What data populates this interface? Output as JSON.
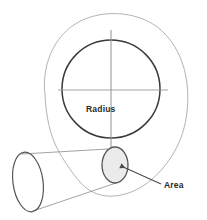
{
  "figure": {
    "background_color": "#ffffff",
    "width": 207,
    "height": 220
  },
  "labels": {
    "radius": "Radius",
    "area": "Area"
  },
  "colors": {
    "outer_contour": "#aaaaaa",
    "circle_stroke": "#3a3a3a",
    "cone_stroke": "#8a8a8a",
    "ellipse_stroke": "#555555",
    "axis_line": "#9a9a9a",
    "arrow": "#7d7d7d",
    "area_leader": "#4a4a4a",
    "small_ellipse_fill": "#ebebeb",
    "text": "#2b2b2b"
  },
  "shapes": {
    "outer_contour": {
      "name": "outer-irregular-contour",
      "stroke_width": 0.9
    },
    "main_circle": {
      "name": "main-circle",
      "center_x": 111,
      "center_y": 89,
      "radius": 49,
      "stroke_width": 1.5
    },
    "horizontal_axis": {
      "name": "horizontal-diameter-line",
      "x1": 58,
      "y1": 90,
      "x2": 168,
      "y2": 90
    },
    "vertical_axis": {
      "name": "vertical-radius-line",
      "x1": 111,
      "y1": 30,
      "x2": 111,
      "y2": 168
    },
    "small_ellipse": {
      "name": "small-cross-section-ellipse",
      "center_x": 115,
      "center_y": 165,
      "rx": 13,
      "ry": 18
    },
    "large_ellipse": {
      "name": "large-cone-base-ellipse",
      "center_x": 28,
      "center_y": 182,
      "rx": 15,
      "ry": 30
    },
    "cone_body": {
      "name": "cone-frustum-body"
    }
  },
  "annotations": {
    "radius_arrow": {
      "name": "radius-arrow",
      "direction": "down",
      "tip_x": 111,
      "tip_y": 167
    },
    "area_leader_line": {
      "name": "area-leader-line",
      "from_x": 160,
      "from_y": 184,
      "to_x": 118,
      "to_y": 165
    }
  }
}
